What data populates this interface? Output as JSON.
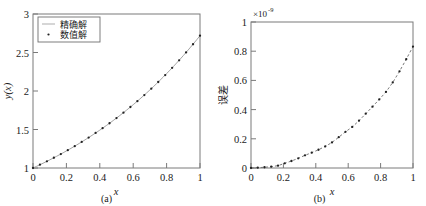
{
  "figure": {
    "panels": [
      {
        "id": "a",
        "caption": "(a)",
        "legend": {
          "entries": [
            {
              "label": "精确解",
              "marker": "line"
            },
            {
              "label": "数值解",
              "marker": "dot"
            }
          ]
        },
        "chart_data": {
          "type": "line",
          "title": "",
          "xlabel": "x",
          "ylabel": "y(x)",
          "xlim": [
            0,
            1
          ],
          "ylim": [
            1,
            3
          ],
          "xticks": [
            0,
            0.2,
            0.4,
            0.6,
            0.8,
            1
          ],
          "xticklabels": [
            "0",
            "0.2",
            "0.4",
            "0.6",
            "0.8",
            "1"
          ],
          "yticks": [
            1,
            1.5,
            2,
            2.5,
            3
          ],
          "yticklabels": [
            "1",
            "1.5",
            "2",
            "2.5",
            "3"
          ],
          "grid": false,
          "legend_position": "upper-left",
          "series": [
            {
              "name": "精确解",
              "style": "line",
              "x": [
                0,
                0.02,
                0.04,
                0.06,
                0.08,
                0.1,
                0.12,
                0.14,
                0.16,
                0.18,
                0.2,
                0.22,
                0.24,
                0.26,
                0.28,
                0.3,
                0.32,
                0.34,
                0.36,
                0.38,
                0.4,
                0.42,
                0.44,
                0.46,
                0.48,
                0.5,
                0.52,
                0.54,
                0.56,
                0.58,
                0.6,
                0.62,
                0.64,
                0.66,
                0.68,
                0.7,
                0.72,
                0.74,
                0.76,
                0.78,
                0.8,
                0.82,
                0.84,
                0.86,
                0.88,
                0.9,
                0.92,
                0.94,
                0.96,
                0.98,
                1
              ],
              "values": [
                1.0,
                1.0202,
                1.0408,
                1.0618,
                1.0833,
                1.1052,
                1.1275,
                1.1503,
                1.1735,
                1.1972,
                1.2214,
                1.2461,
                1.2712,
                1.2969,
                1.3231,
                1.3499,
                1.3771,
                1.405,
                1.4333,
                1.4623,
                1.4918,
                1.522,
                1.5527,
                1.5841,
                1.6161,
                1.6487,
                1.682,
                1.716,
                1.7507,
                1.786,
                1.8221,
                1.8589,
                1.8965,
                1.9348,
                1.9739,
                2.0138,
                2.0544,
                2.0959,
                2.1383,
                2.1815,
                2.2255,
                2.2705,
                2.3164,
                2.3632,
                2.4109,
                2.4596,
                2.5093,
                2.56,
                2.6117,
                2.6645,
                2.7183
              ]
            },
            {
              "name": "数值解",
              "style": "markers",
              "x": [
                0,
                0.0417,
                0.0833,
                0.125,
                0.1667,
                0.2083,
                0.25,
                0.2917,
                0.3333,
                0.375,
                0.4167,
                0.4583,
                0.5,
                0.5417,
                0.5833,
                0.625,
                0.6667,
                0.7083,
                0.75,
                0.7917,
                0.8333,
                0.875,
                0.9167,
                0.9583,
                1
              ],
              "values": [
                1.0,
                1.0426,
                1.0869,
                1.1331,
                1.1814,
                1.2317,
                1.284,
                1.3388,
                1.3956,
                1.455,
                1.5168,
                1.5814,
                1.6487,
                1.7189,
                1.792,
                1.8682,
                1.9477,
                2.0306,
                2.117,
                2.2071,
                2.301,
                2.3989,
                2.5009,
                2.6074,
                2.7183
              ]
            }
          ]
        }
      },
      {
        "id": "b",
        "caption": "(b)",
        "chart_data": {
          "type": "line",
          "title": "",
          "xlabel": "x",
          "ylabel": "误差",
          "exponent_label": "×10",
          "exponent_value": "-9",
          "xlim": [
            0,
            1
          ],
          "ylim": [
            0,
            1
          ],
          "xticks": [
            0,
            0.2,
            0.4,
            0.6,
            0.8,
            1
          ],
          "xticklabels": [
            "0",
            "0.2",
            "0.4",
            "0.6",
            "0.8",
            "1"
          ],
          "yticks": [
            0,
            0.2,
            0.4,
            0.6,
            0.8,
            1
          ],
          "yticklabels": [
            "0",
            "0.2",
            "0.4",
            "0.6",
            "0.8",
            "1"
          ],
          "grid": false,
          "legend_position": "none",
          "series": [
            {
              "name": "误差",
              "style": "line-markers",
              "x": [
                0,
                0.0417,
                0.0833,
                0.125,
                0.1667,
                0.2083,
                0.25,
                0.2917,
                0.3333,
                0.375,
                0.4167,
                0.4583,
                0.5,
                0.5417,
                0.5833,
                0.625,
                0.6667,
                0.7083,
                0.75,
                0.7917,
                0.8333,
                0.875,
                0.9167,
                0.9583,
                1
              ],
              "values": [
                0.0,
                0.002,
                0.005,
                0.009,
                0.016,
                0.032,
                0.048,
                0.066,
                0.087,
                0.105,
                0.125,
                0.148,
                0.175,
                0.211,
                0.248,
                0.281,
                0.324,
                0.372,
                0.42,
                0.47,
                0.521,
                0.586,
                0.662,
                0.745,
                0.832
              ]
            }
          ]
        }
      }
    ]
  },
  "style": {
    "line_color": "#888888",
    "marker_color": "#222222",
    "axis_color": "#7a7a7a",
    "text_color": "#1a1a1a"
  }
}
